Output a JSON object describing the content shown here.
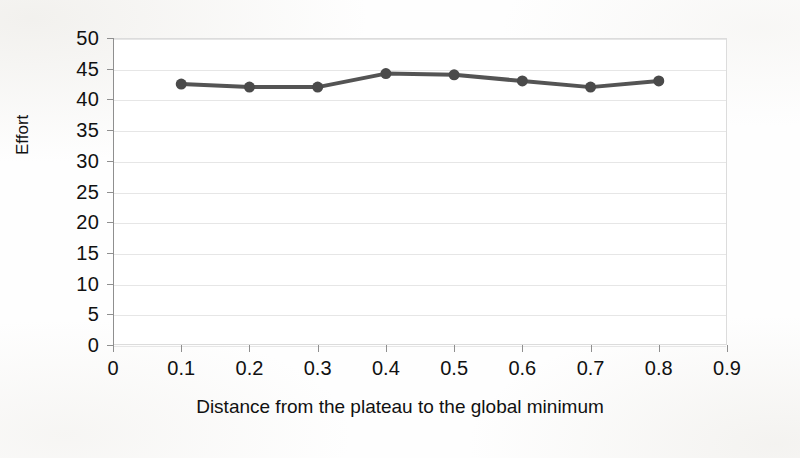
{
  "chart_data": {
    "type": "line",
    "title": "",
    "xlabel": "Distance from the plateau to the global minimum",
    "ylabel": "Effort",
    "x": [
      0.1,
      0.2,
      0.3,
      0.4,
      0.5,
      0.6,
      0.7,
      0.8
    ],
    "values": [
      42.5,
      42.0,
      42.0,
      44.2,
      44.0,
      43.0,
      42.0,
      43.0
    ],
    "series": [
      {
        "name": "Effort",
        "values": [
          42.5,
          42.0,
          42.0,
          44.2,
          44.0,
          43.0,
          42.0,
          43.0
        ]
      }
    ],
    "xlim": [
      0,
      0.9
    ],
    "ylim": [
      0,
      50
    ],
    "x_tick_labels": [
      "0",
      "0.1",
      "0.2",
      "0.3",
      "0.4",
      "0.5",
      "0.6",
      "0.7",
      "0.8",
      "0.9"
    ],
    "x_tick_values": [
      0,
      0.1,
      0.2,
      0.3,
      0.4,
      0.5,
      0.6,
      0.7,
      0.8,
      0.9
    ],
    "y_tick_labels": [
      "0",
      "5",
      "10",
      "15",
      "20",
      "25",
      "30",
      "35",
      "40",
      "45",
      "50"
    ],
    "y_tick_values": [
      0,
      5,
      10,
      15,
      20,
      25,
      30,
      35,
      40,
      45,
      50
    ],
    "grid": {
      "horizontal": true,
      "vertical": false,
      "color": "#e6e6e6"
    },
    "legend": {
      "visible": false,
      "position": "none",
      "entries": []
    },
    "style": {
      "line_color": "#545454",
      "marker_color": "#4a4a4a",
      "marker_shape": "circle",
      "marker_size": 11,
      "line_width": 4,
      "background_color": "#ffffff",
      "axis_color": "#8f8f8f",
      "text_color": "#111111"
    },
    "annotations": []
  }
}
